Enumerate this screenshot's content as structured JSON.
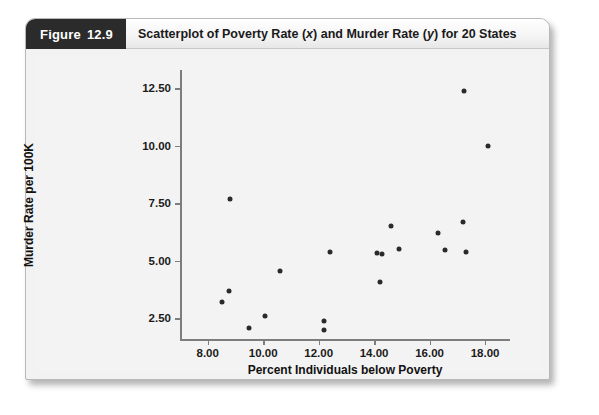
{
  "figure": {
    "tag_word": "Figure",
    "tag_number": "12.9",
    "caption_part1": "Scatterplot of Poverty Rate (",
    "caption_ital1": "x",
    "caption_part2": ") and Murder Rate (",
    "caption_ital2": "y",
    "caption_part3": ") for 20 States",
    "caption_full": "Scatterplot of Poverty Rate (x) and Murder Rate (y) for 20 States"
  },
  "colors": {
    "tag_background": "#2b2b2b",
    "tag_text": "#ffffff",
    "card_background": "#f2f2f2",
    "plot_background": "#f3f3f3",
    "axis": "#7d7d7d",
    "point": "#2a2a2a"
  },
  "chart_data": {
    "type": "scatter",
    "title": "Scatterplot of Poverty Rate (x) and Murder Rate (y) for 20 States",
    "xlabel": "Percent Individuals below Poverty",
    "ylabel": "Murder Rate per 100K",
    "xlim": [
      7.0,
      18.9
    ],
    "ylim": [
      1.6,
      13.3
    ],
    "xticks": [
      8.0,
      10.0,
      12.0,
      14.0,
      16.0,
      18.0
    ],
    "xticklabels": [
      "8.00",
      "10.00",
      "12.00",
      "14.00",
      "16.00",
      "18.00"
    ],
    "yticks": [
      2.5,
      5.0,
      7.5,
      10.0,
      12.5
    ],
    "yticklabels": [
      "2.50",
      "5.00",
      "7.50",
      "10.00",
      "12.50"
    ],
    "grid": false,
    "legend": null,
    "n_points": 20,
    "points": [
      {
        "x": 8.8,
        "y": 7.7
      },
      {
        "x": 8.75,
        "y": 3.7
      },
      {
        "x": 8.5,
        "y": 3.2
      },
      {
        "x": 9.5,
        "y": 2.1
      },
      {
        "x": 10.05,
        "y": 2.6
      },
      {
        "x": 10.6,
        "y": 4.55
      },
      {
        "x": 12.2,
        "y": 2.4
      },
      {
        "x": 12.2,
        "y": 2.0
      },
      {
        "x": 12.4,
        "y": 5.4
      },
      {
        "x": 14.1,
        "y": 5.35
      },
      {
        "x": 14.3,
        "y": 5.3
      },
      {
        "x": 14.2,
        "y": 4.1
      },
      {
        "x": 14.6,
        "y": 6.5
      },
      {
        "x": 14.9,
        "y": 5.5
      },
      {
        "x": 16.3,
        "y": 6.2
      },
      {
        "x": 16.55,
        "y": 5.45
      },
      {
        "x": 17.2,
        "y": 6.7
      },
      {
        "x": 17.3,
        "y": 5.4
      },
      {
        "x": 17.25,
        "y": 12.4
      },
      {
        "x": 18.1,
        "y": 10.0
      }
    ]
  }
}
